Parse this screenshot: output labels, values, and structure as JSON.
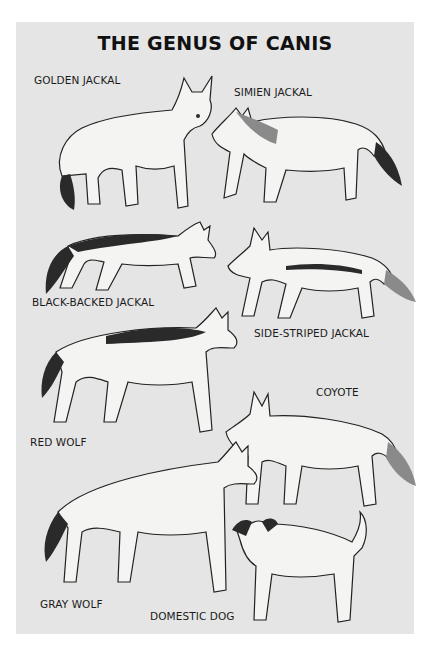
{
  "title": "THE GENUS OF CANIS",
  "colors": {
    "panel": "#e5e5e5",
    "page": "#ffffff",
    "ink": "#111111"
  },
  "species": [
    {
      "name": "GOLDEN JACKAL"
    },
    {
      "name": "SIMIEN JACKAL"
    },
    {
      "name": "BLACK-BACKED JACKAL"
    },
    {
      "name": "SIDE-STRIPED JACKAL"
    },
    {
      "name": "RED WOLF"
    },
    {
      "name": "COYOTE"
    },
    {
      "name": "GRAY WOLF"
    },
    {
      "name": "DOMESTIC DOG"
    }
  ]
}
